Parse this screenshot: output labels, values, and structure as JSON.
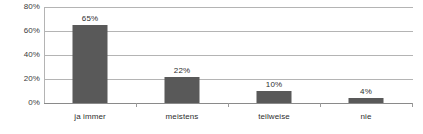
{
  "chart_data": {
    "type": "bar",
    "title": "",
    "subtitle": "",
    "xlabel": "",
    "ylabel": "",
    "categories": [
      "ja immer",
      "meistens",
      "teilweise",
      "nie"
    ],
    "values": [
      65,
      22,
      10,
      4
    ],
    "value_labels": [
      "65%",
      "22%",
      "10%",
      "4%"
    ],
    "ylim": [
      0,
      80
    ],
    "y_ticks": [
      0,
      20,
      40,
      60,
      80
    ],
    "y_tick_labels": [
      "0%",
      "20%",
      "40%",
      "60%",
      "80%"
    ],
    "grid": true,
    "grid_axis": "y",
    "legend": false,
    "legend_position": "none",
    "series": [
      {
        "name": "",
        "values": [
          65,
          22,
          10,
          4
        ],
        "color": "#595959"
      }
    ],
    "colors": {
      "bar": "#595959",
      "gridline": "#b4b4b4",
      "axis": "#8a8a8a",
      "tick_label": "#3b3b3b",
      "data_label": "#2e2e2e",
      "background": "#ffffff"
    }
  }
}
